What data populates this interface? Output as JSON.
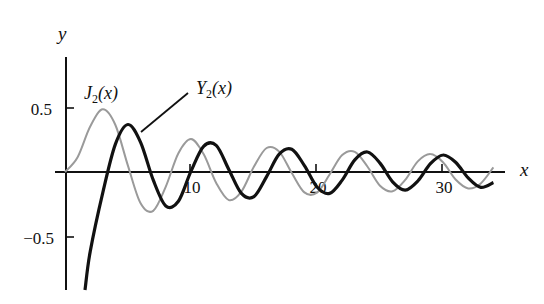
{
  "chart_data": {
    "type": "line",
    "title": "",
    "xlabel": "x",
    "ylabel": "y",
    "xlim": [
      0,
      34
    ],
    "ylim": [
      -0.9,
      0.5
    ],
    "grid": false,
    "legend": "inline labels with pointer",
    "x_ticks": [
      10,
      20,
      30
    ],
    "x_tick_labels": [
      "10",
      "20",
      "30"
    ],
    "y_ticks": [
      0.5,
      -0.5
    ],
    "y_tick_labels": [
      "0.5",
      "−0.5"
    ],
    "x": [
      0,
      1,
      2,
      3,
      4,
      5,
      6,
      7,
      8,
      9,
      10,
      11,
      12,
      13,
      14,
      15,
      16,
      17,
      18,
      19,
      20,
      21,
      22,
      23,
      24,
      25,
      26,
      27,
      28,
      29,
      30,
      31,
      32,
      33,
      34
    ],
    "series": [
      {
        "name": "J2(x)",
        "label_main": "J",
        "label_sub": "2",
        "label_arg": "(x)",
        "color": "#9a9a9a",
        "style": "thin gray",
        "values": [
          0,
          0.115,
          0.353,
          0.486,
          0.364,
          0.047,
          -0.243,
          -0.301,
          -0.113,
          0.145,
          0.255,
          0.139,
          -0.085,
          -0.218,
          -0.152,
          0.042,
          0.186,
          0.158,
          -0.008,
          -0.158,
          -0.16,
          -0.019,
          0.131,
          0.156,
          0.043,
          -0.106,
          -0.149,
          -0.061,
          0.082,
          0.139,
          0.076,
          -0.058,
          -0.127,
          -0.088,
          0.036
        ]
      },
      {
        "name": "Y2(x)",
        "label_main": "Y",
        "label_sub": "2",
        "label_arg": "(x)",
        "color": "#111111",
        "style": "thick black",
        "values": [
          null,
          -1.651,
          -0.617,
          -0.16,
          0.216,
          0.368,
          0.23,
          -0.061,
          -0.263,
          -0.226,
          0.006,
          0.199,
          0.206,
          0.02,
          -0.166,
          -0.191,
          -0.036,
          0.139,
          0.177,
          0.05,
          -0.116,
          -0.166,
          -0.063,
          0.094,
          0.155,
          0.069,
          -0.076,
          -0.14,
          -0.07,
          0.064,
          0.132,
          0.076,
          -0.046,
          -0.119,
          -0.082
        ]
      }
    ]
  },
  "labels": {
    "x_axis": "x",
    "y_axis": "y",
    "tick_x_10": "10",
    "tick_x_20": "20",
    "tick_x_30": "30",
    "tick_y_pos": "0.5",
    "tick_y_neg": "−0.5"
  }
}
